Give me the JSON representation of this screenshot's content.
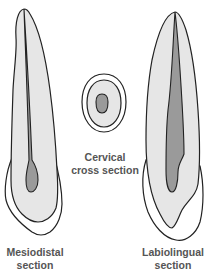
{
  "figure": {
    "colors": {
      "outline": "#222222",
      "enamel_fill": "#ffffff",
      "dentin_fill": "#e6e6e6",
      "pulp_fill": "#9a9a9a",
      "label_text": "#555555"
    }
  },
  "labels": {
    "mesiodistal": {
      "line1": "Mesiodistal",
      "line2": "section"
    },
    "cervical": {
      "line1": "Cervical",
      "line2": "cross section"
    },
    "labiolingual": {
      "line1": "Labiolingual",
      "line2": "section"
    }
  }
}
